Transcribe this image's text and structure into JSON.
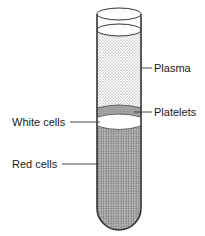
{
  "diagram": {
    "labels": {
      "plasma": "Plasma",
      "platelets": "Platelets",
      "white_cells": "White cells",
      "red_cells": "Red cells"
    },
    "colors": {
      "outline": "#333333",
      "plasma_dots": "#555555",
      "red_cells_fill": "#9a9a9a",
      "background": "#ffffff"
    }
  }
}
